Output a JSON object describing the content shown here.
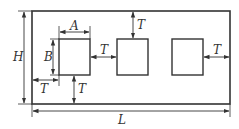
{
  "diagram": {
    "type": "dimensioned-layout",
    "labels": {
      "length": "L",
      "height": "H",
      "width_a": "A",
      "height_b": "B",
      "spacing_left": "T",
      "spacing_bottom": "T",
      "spacing_between": "T",
      "spacing_top": "T",
      "spacing_right": "T"
    },
    "colors": {
      "line": "#333333",
      "background": "#ffffff"
    },
    "cutout_count": 3
  }
}
